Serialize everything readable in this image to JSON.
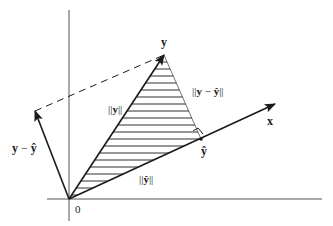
{
  "diagram": {
    "labels": {
      "y": "y",
      "x": "x",
      "y_hat": "ŷ",
      "y_minus_y_hat": "y − ŷ",
      "origin": "0",
      "norm_y": "||y||",
      "norm_y_minus_y_hat": "||y − ŷ||",
      "norm_y_hat": "||ŷ||"
    },
    "label_parts": {
      "norm_y_prefix": "||",
      "norm_y_bold": "y",
      "norm_y_suffix": "||",
      "norm_diff_prefix": "||",
      "norm_diff_bold1": "y",
      "norm_diff_minus": " − ",
      "norm_diff_bold2": "ŷ",
      "norm_diff_suffix": "||",
      "norm_yhat_prefix": "||",
      "norm_yhat_bold": "ŷ",
      "norm_yhat_suffix": "||",
      "diff_bold1": "y",
      "diff_minus": " − ",
      "diff_bold2": "ŷ"
    },
    "points": {
      "origin": [
        69,
        199
      ],
      "y_tip": [
        164,
        55
      ],
      "y_hat": [
        201,
        139
      ],
      "x_tip": [
        275,
        104
      ],
      "y_minus_y_hat_tip": [
        35,
        111
      ]
    },
    "colors": {
      "ink": "#1a1a1a",
      "axis": "#555555",
      "background": "#ffffff"
    }
  }
}
